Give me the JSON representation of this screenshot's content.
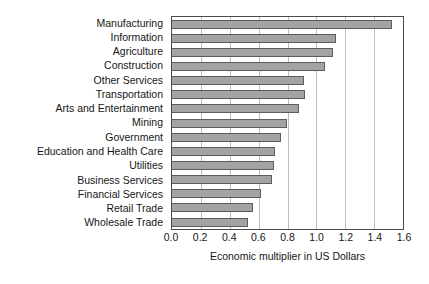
{
  "chart_data": {
    "type": "bar",
    "orientation": "horizontal",
    "title": "",
    "subtitle": "",
    "xlabel": "Economic multiplier in US Dollars",
    "ylabel": "",
    "xlim": [
      0.0,
      1.6
    ],
    "xticks": [
      "0.0",
      "0.2",
      "0.4",
      "0.6",
      "0.8",
      "1.0",
      "1.2",
      "1.4",
      "1.6"
    ],
    "xtick_values": [
      0.0,
      0.2,
      0.4,
      0.6,
      0.8,
      1.0,
      1.2,
      1.4,
      1.6
    ],
    "grid": true,
    "grid_axis": "x",
    "legend": null,
    "legend_position": "none",
    "bar_fill_color": "#a3a3a3",
    "bar_edge_color": "#5d5d5d",
    "grid_color": "#bdbdbd",
    "axis_color": "#4b4b4b",
    "categories": [
      "Manufacturing",
      "Information",
      "Agriculture",
      "Construction",
      "Other Services",
      "Transportation",
      "Arts and Entertainment",
      "Mining",
      "Government",
      "Education and Health Care",
      "Utilities",
      "Business Services",
      "Financial Services",
      "Retail Trade",
      "Wholesale Trade"
    ],
    "values": [
      1.53,
      1.14,
      1.12,
      1.07,
      0.92,
      0.93,
      0.89,
      0.8,
      0.76,
      0.72,
      0.71,
      0.7,
      0.62,
      0.57,
      0.53
    ]
  }
}
